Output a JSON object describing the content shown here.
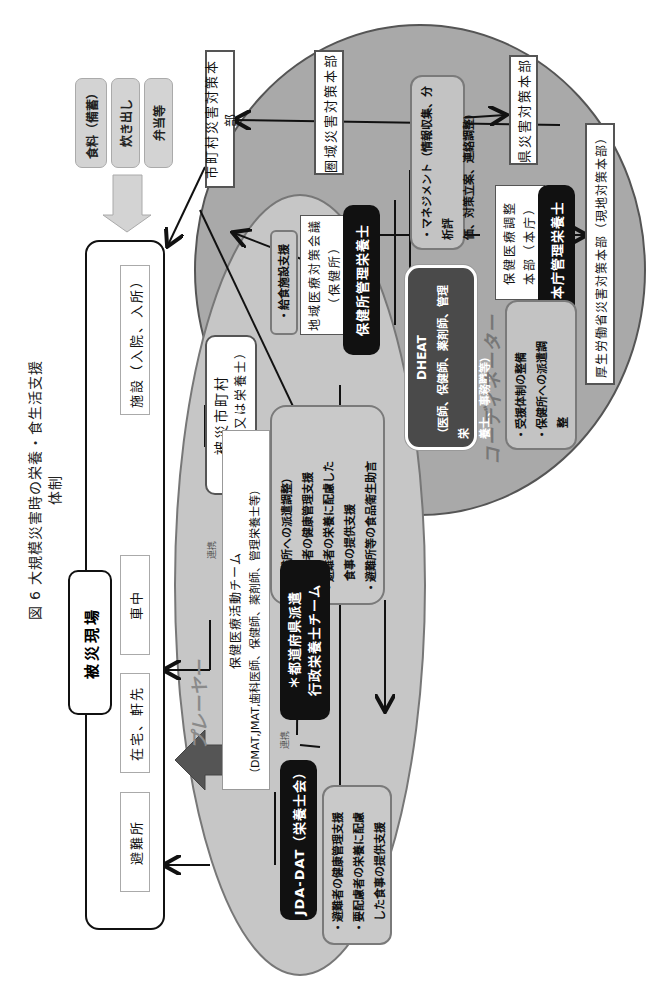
{
  "title": "図 6 大規模災害時の栄養・食生活支援体制",
  "disaster_site": {
    "label": "被災現場",
    "locations": [
      "避難所",
      "在宅、軒先",
      "車中",
      "施設（入院、入所）"
    ]
  },
  "food_supply": [
    "食料（備蓄）",
    "炊き出し",
    "弁当等"
  ],
  "headquarters": {
    "municipal": "市町村災害対策本部",
    "regional": "圏域災害対策本部",
    "prefectural": "県災害対策本部",
    "mhlw": "厚生労働省災害対策本部（現地対策本部）"
  },
  "coordinator": {
    "label": "コーディネーター",
    "regional_council_line1": "地域医療対策会議",
    "regional_council_line2": "（保健所）",
    "health_center_dietitian": "保健所管理栄養士",
    "management_box": [
      "・マネジメント（情報収集、分析評",
      "価、対策立案、連絡調整）"
    ],
    "pref_coord_line1": "保健医療調整",
    "pref_coord_line2": "本部（本庁）",
    "pref_dietitian": "本庁管理栄養士",
    "dheat_title": "DHEAT",
    "dheat_lines": [
      "（医師、保健師、薬剤師、管理栄",
      "養士、事務職等）"
    ],
    "support_box": [
      "・受援体制の整備",
      "・保健所への派遣調",
      "整"
    ]
  },
  "player": {
    "label": "プレーヤー",
    "affected_municipality_line1": "被災市町村",
    "affected_municipality_line2": "（保健師又は栄養士）",
    "facility_support": "・給食施設支援",
    "dispatch_box": [
      "（避難所への派遣調整）",
      "・避難者の健康管理支援",
      "・避難者の栄養に配慮した",
      "食事の提供支援",
      "・避難所等の食品衛生助言"
    ],
    "medical_team_line1": "保健医療活動チーム",
    "medical_team_line2": "（DMAT,JMAT,歯科医師、保健師、薬剤師、管理栄養士等）",
    "pref_team_line1": "＊都道府県派遣",
    "pref_team_line2": "行政栄養士チーム",
    "jda_dat": "JDA-DAT（栄養士会）",
    "jda_box": [
      "・避難者の健康管理支援",
      "・要配慮者の栄養に配慮",
      "した食事の提供支援"
    ],
    "cooperation_1": "連携",
    "cooperation_2": "連携"
  }
}
